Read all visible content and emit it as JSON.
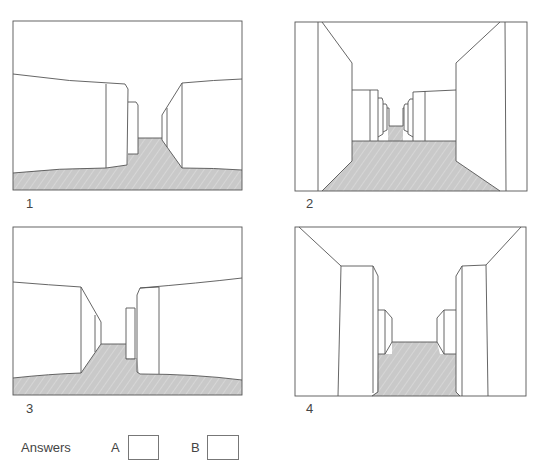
{
  "figures": [
    {
      "number": "1"
    },
    {
      "number": "2"
    },
    {
      "number": "3"
    },
    {
      "number": "4"
    }
  ],
  "answers": {
    "label": "Answers",
    "options": [
      {
        "letter": "A",
        "value": ""
      },
      {
        "letter": "B",
        "value": ""
      }
    ]
  },
  "colors": {
    "line": "#555555",
    "floor": "#c8c8c8",
    "background": "#ffffff"
  }
}
